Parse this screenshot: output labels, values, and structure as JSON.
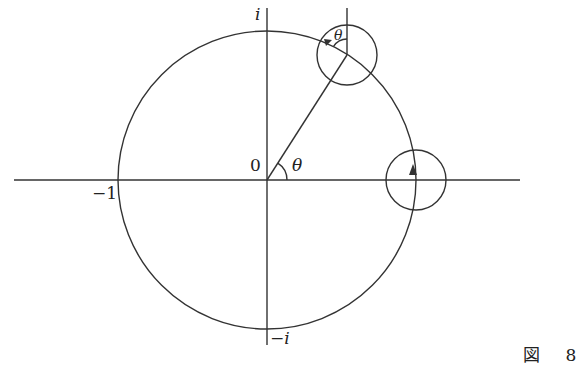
{
  "diagram": {
    "labels": {
      "imag_pos": "i",
      "imag_neg": "−i",
      "real_neg": "−1",
      "origin": "0",
      "angle_origin": "θ",
      "angle_top": "θ"
    },
    "caption": "図 8",
    "colors": {
      "stroke": "#333333",
      "background": "#ffffff"
    },
    "geometry": {
      "center": [
        267,
        180
      ],
      "radius": 148,
      "angle_deg": 60,
      "small_circle_radius": 30,
      "small_circles": [
        {
          "name": "at-angle-theta",
          "center": [
            347,
            55
          ]
        },
        {
          "name": "at-one",
          "center": [
            415,
            180
          ]
        }
      ]
    }
  }
}
